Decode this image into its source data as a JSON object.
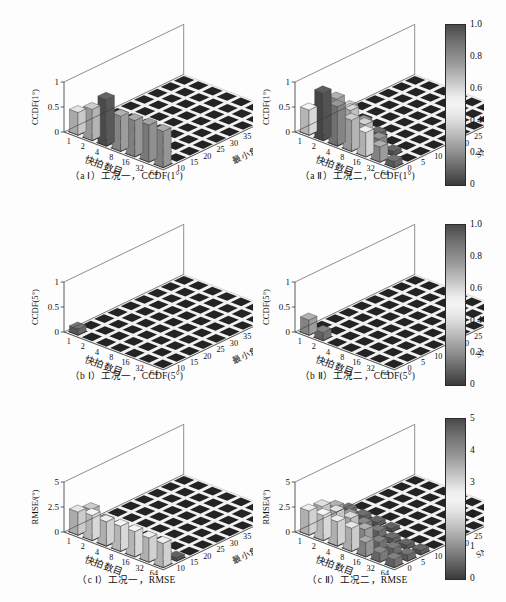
{
  "figure": {
    "title": "",
    "background": "#fdfdfd",
    "layout": "3 rows x 2 columns of 3-D bar plots, each row shares a grayscale colorbar at right"
  },
  "panels": [
    {
      "id": "a1",
      "caption": "（a Ⅰ）工况一，CCDF(1°)",
      "zlabel": "CCDF(1°)",
      "xlabel": "快拍数目",
      "ylabel": "最小角距离/(°)",
      "zticks": [
        "0",
        "0.5",
        "1"
      ],
      "xticks": [
        "1",
        "2",
        "4",
        "8",
        "16",
        "32",
        "64"
      ],
      "yticks": [
        "10",
        "15",
        "20",
        "25",
        "30",
        "35",
        "40",
        "45",
        "50"
      ]
    },
    {
      "id": "a2",
      "caption": "（a Ⅱ）工况二，CCDF(1°)",
      "zlabel": "CCDF(1°)",
      "xlabel": "快拍数目",
      "ylabel": "SNR/dB",
      "zticks": [
        "0",
        "0.5",
        "1"
      ],
      "xticks": [
        "1",
        "2",
        "4",
        "8",
        "16",
        "32",
        "64"
      ],
      "yticks": [
        "0",
        "5",
        "10",
        "15",
        "20",
        "25",
        "30",
        "35",
        "40"
      ]
    },
    {
      "id": "b1",
      "caption": "（b Ⅰ）工况一，CCDF(5°)",
      "zlabel": "CCDF(5°)",
      "xlabel": "快拍数目",
      "ylabel": "最小角距离/(°)",
      "zticks": [
        "0",
        "0.5",
        "1"
      ],
      "xticks": [
        "1",
        "2",
        "4",
        "8",
        "16",
        "32",
        "64"
      ],
      "yticks": [
        "10",
        "15",
        "20",
        "25",
        "30",
        "35",
        "40",
        "45",
        "50"
      ]
    },
    {
      "id": "b2",
      "caption": "（b Ⅱ）工况二，CCDF(5°)",
      "zlabel": "CCDF(5°)",
      "xlabel": "快拍数目",
      "ylabel": "SNR/dB",
      "zticks": [
        "0",
        "0.5",
        "1"
      ],
      "xticks": [
        "1",
        "2",
        "4",
        "8",
        "16",
        "32",
        "64"
      ],
      "yticks": [
        "0",
        "5",
        "10",
        "15",
        "20",
        "25",
        "30",
        "35",
        "40"
      ]
    },
    {
      "id": "c1",
      "caption": "（c Ⅰ）工况一，RMSE",
      "zlabel": "RMSE/(°)",
      "xlabel": "快拍数目",
      "ylabel": "最小角距离/(°)",
      "zticks": [
        "0",
        "2.5",
        "5"
      ],
      "xticks": [
        "1",
        "2",
        "4",
        "8",
        "16",
        "32",
        "64"
      ],
      "yticks": [
        "10",
        "15",
        "20",
        "25",
        "30",
        "35",
        "40",
        "45",
        "50"
      ]
    },
    {
      "id": "c2",
      "caption": "（c Ⅱ）工况二，RMSE",
      "zlabel": "RMSE/(°)",
      "xlabel": "快拍数目",
      "ylabel": "SNR/dB",
      "zticks": [
        "0",
        "2.5",
        "5"
      ],
      "xticks": [
        "1",
        "2",
        "4",
        "8",
        "16",
        "32",
        "64"
      ],
      "yticks": [
        "0",
        "5",
        "10",
        "15",
        "20",
        "25",
        "30",
        "35",
        "40"
      ]
    }
  ],
  "colorbars": [
    {
      "id": "cb-row1",
      "min": 0,
      "max": 1.0,
      "ticks": [
        "1.0",
        "0.8",
        "0.6",
        "0.4",
        "0.2",
        "0"
      ]
    },
    {
      "id": "cb-row2",
      "min": 0,
      "max": 1.0,
      "ticks": [
        "1.0",
        "0.8",
        "0.6",
        "0.4",
        "0.2",
        "0"
      ]
    },
    {
      "id": "cb-row3",
      "min": 0,
      "max": 5,
      "ticks": [
        "5",
        "4",
        "3",
        "2",
        "1",
        "0"
      ]
    }
  ],
  "chart_data": [
    {
      "id": "a1",
      "type": "bar",
      "title": "（a Ⅰ）工况一，CCDF(1°)",
      "xlabel": "快拍数目",
      "ylabel": "最小角距离/(°)",
      "zlabel": "CCDF(1°)",
      "x": [
        1,
        2,
        4,
        8,
        16,
        32,
        64
      ],
      "y": [
        10,
        15,
        20,
        25,
        30,
        35,
        40,
        45,
        50
      ],
      "zlim": [
        0,
        1
      ],
      "grid": true,
      "values": [
        [
          0.45,
          0.62,
          0.93,
          0.7,
          0.72,
          0.74,
          0.72
        ],
        [
          0.35,
          0.52,
          0.1,
          0.0,
          0.0,
          0.0,
          0.0
        ],
        [
          0.0,
          0.0,
          0.0,
          0.0,
          0.0,
          0.0,
          0.0
        ],
        [
          0.0,
          0.0,
          0.0,
          0.0,
          0.0,
          0.0,
          0.0
        ],
        [
          0.0,
          0.0,
          0.0,
          0.0,
          0.0,
          0.0,
          0.0
        ],
        [
          0.0,
          0.0,
          0.0,
          0.0,
          0.0,
          0.0,
          0.0
        ],
        [
          0.0,
          0.0,
          0.0,
          0.0,
          0.0,
          0.0,
          0.0
        ],
        [
          0.0,
          0.0,
          0.0,
          0.0,
          0.0,
          0.0,
          0.0
        ],
        [
          0.0,
          0.0,
          0.0,
          0.0,
          0.0,
          0.0,
          0.0
        ]
      ]
    },
    {
      "id": "a2",
      "type": "bar",
      "title": "（a Ⅱ）工况二，CCDF(1°)",
      "xlabel": "快拍数目",
      "ylabel": "SNR/dB",
      "zlabel": "CCDF(1°)",
      "x": [
        1,
        2,
        4,
        8,
        16,
        32,
        64
      ],
      "y": [
        0,
        5,
        10,
        15,
        20,
        25,
        30,
        35,
        40
      ],
      "zlim": [
        0,
        1
      ],
      "grid": true,
      "values": [
        [
          0.5,
          0.95,
          0.78,
          0.62,
          0.48,
          0.3,
          0.12
        ],
        [
          0.42,
          0.7,
          0.58,
          0.4,
          0.22,
          0.08,
          0.0
        ],
        [
          0.3,
          0.4,
          0.22,
          0.1,
          0.0,
          0.0,
          0.0
        ],
        [
          0.0,
          0.0,
          0.0,
          0.0,
          0.0,
          0.0,
          0.0
        ],
        [
          0.0,
          0.0,
          0.0,
          0.0,
          0.0,
          0.0,
          0.0
        ],
        [
          0.0,
          0.0,
          0.0,
          0.0,
          0.0,
          0.0,
          0.0
        ],
        [
          0.0,
          0.0,
          0.0,
          0.0,
          0.0,
          0.0,
          0.0
        ],
        [
          0.0,
          0.0,
          0.0,
          0.0,
          0.0,
          0.0,
          0.0
        ],
        [
          0.0,
          0.0,
          0.0,
          0.0,
          0.0,
          0.0,
          0.0
        ]
      ]
    },
    {
      "id": "b1",
      "type": "bar",
      "title": "（b Ⅰ）工况一，CCDF(5°)",
      "xlabel": "快拍数目",
      "ylabel": "最小角距离/(°)",
      "zlabel": "CCDF(5°)",
      "x": [
        1,
        2,
        4,
        8,
        16,
        32,
        64
      ],
      "y": [
        10,
        15,
        20,
        25,
        30,
        35,
        40,
        45,
        50
      ],
      "zlim": [
        0,
        1
      ],
      "grid": true,
      "values": [
        [
          0.12,
          0.0,
          0.0,
          0.0,
          0.0,
          0.0,
          0.0
        ],
        [
          0.0,
          0.0,
          0.0,
          0.0,
          0.0,
          0.0,
          0.0
        ],
        [
          0.0,
          0.0,
          0.0,
          0.0,
          0.0,
          0.0,
          0.0
        ],
        [
          0.0,
          0.0,
          0.0,
          0.0,
          0.0,
          0.0,
          0.0
        ],
        [
          0.0,
          0.0,
          0.0,
          0.0,
          0.0,
          0.0,
          0.0
        ],
        [
          0.0,
          0.0,
          0.0,
          0.0,
          0.0,
          0.0,
          0.0
        ],
        [
          0.0,
          0.0,
          0.0,
          0.0,
          0.0,
          0.0,
          0.0
        ],
        [
          0.0,
          0.0,
          0.0,
          0.0,
          0.0,
          0.0,
          0.0
        ],
        [
          0.0,
          0.0,
          0.0,
          0.0,
          0.0,
          0.0,
          0.0
        ]
      ]
    },
    {
      "id": "b2",
      "type": "bar",
      "title": "（b Ⅱ）工况二，CCDF(5°)",
      "xlabel": "快拍数目",
      "ylabel": "SNR/dB",
      "zlabel": "CCDF(5°)",
      "x": [
        1,
        2,
        4,
        8,
        16,
        32,
        64
      ],
      "y": [
        0,
        5,
        10,
        15,
        20,
        25,
        30,
        35,
        40
      ],
      "zlim": [
        0,
        1
      ],
      "grid": true,
      "values": [
        [
          0.3,
          0.16,
          0.0,
          0.0,
          0.0,
          0.0,
          0.0
        ],
        [
          0.0,
          0.0,
          0.0,
          0.0,
          0.0,
          0.0,
          0.0
        ],
        [
          0.0,
          0.0,
          0.0,
          0.0,
          0.0,
          0.0,
          0.0
        ],
        [
          0.0,
          0.0,
          0.0,
          0.0,
          0.0,
          0.0,
          0.0
        ],
        [
          0.0,
          0.0,
          0.0,
          0.0,
          0.0,
          0.0,
          0.0
        ],
        [
          0.0,
          0.0,
          0.0,
          0.0,
          0.0,
          0.0,
          0.0
        ],
        [
          0.0,
          0.0,
          0.0,
          0.0,
          0.0,
          0.0,
          0.0
        ],
        [
          0.0,
          0.0,
          0.0,
          0.0,
          0.0,
          0.0,
          0.0
        ],
        [
          0.0,
          0.0,
          0.0,
          0.0,
          0.0,
          0.0,
          0.0
        ]
      ]
    },
    {
      "id": "c1",
      "type": "bar",
      "title": "（c Ⅰ）工况一，RMSE",
      "xlabel": "快拍数目",
      "ylabel": "最小角距离/(°)",
      "zlabel": "RMSE/(°)",
      "x": [
        1,
        2,
        4,
        8,
        16,
        32,
        64
      ],
      "y": [
        10,
        15,
        20,
        25,
        30,
        35,
        40,
        45,
        50
      ],
      "zlim": [
        0,
        5
      ],
      "grid": true,
      "values": [
        [
          2.3,
          2.5,
          2.4,
          2.5,
          2.5,
          2.4,
          2.4
        ],
        [
          1.9,
          1.3,
          0.6,
          0.4,
          0.3,
          0.3,
          0.3
        ],
        [
          0.0,
          0.0,
          0.0,
          0.0,
          0.0,
          0.0,
          0.0
        ],
        [
          0.0,
          0.0,
          0.0,
          0.0,
          0.0,
          0.0,
          0.0
        ],
        [
          0.0,
          0.0,
          0.0,
          0.0,
          0.0,
          0.0,
          0.0
        ],
        [
          0.0,
          0.0,
          0.0,
          0.0,
          0.0,
          0.0,
          0.0
        ],
        [
          0.0,
          0.0,
          0.0,
          0.0,
          0.0,
          0.0,
          0.0
        ],
        [
          0.0,
          0.0,
          0.0,
          0.0,
          0.0,
          0.0,
          0.0
        ],
        [
          0.0,
          0.0,
          0.0,
          0.0,
          0.0,
          0.0,
          0.0
        ]
      ]
    },
    {
      "id": "c2",
      "type": "bar",
      "title": "（c Ⅱ）工况二，RMSE",
      "xlabel": "快拍数目",
      "ylabel": "SNR/dB",
      "zlabel": "RMSE/(°)",
      "x": [
        1,
        2,
        4,
        8,
        16,
        32,
        64
      ],
      "y": [
        0,
        5,
        10,
        15,
        20,
        25,
        30,
        35,
        40
      ],
      "zlim": [
        0,
        5
      ],
      "grid": true,
      "values": [
        [
          2.4,
          2.5,
          2.4,
          2.3,
          1.4,
          0.9,
          0.8
        ],
        [
          2.2,
          2.2,
          2.1,
          1.5,
          0.8,
          0.7,
          0.6
        ],
        [
          1.5,
          1.2,
          0.9,
          0.7,
          0.5,
          0.4,
          0.4
        ],
        [
          0.6,
          0.5,
          0.4,
          0.3,
          0.0,
          0.0,
          0.0
        ],
        [
          0.0,
          0.0,
          0.0,
          0.0,
          0.0,
          0.0,
          0.0
        ],
        [
          0.0,
          0.0,
          0.0,
          0.0,
          0.0,
          0.0,
          0.0
        ],
        [
          0.0,
          0.0,
          0.0,
          0.0,
          0.0,
          0.0,
          0.0
        ],
        [
          0.0,
          0.0,
          0.0,
          0.0,
          0.0,
          0.0,
          0.0
        ],
        [
          0.0,
          0.0,
          0.0,
          0.0,
          0.0,
          0.0,
          0.0
        ]
      ]
    }
  ]
}
